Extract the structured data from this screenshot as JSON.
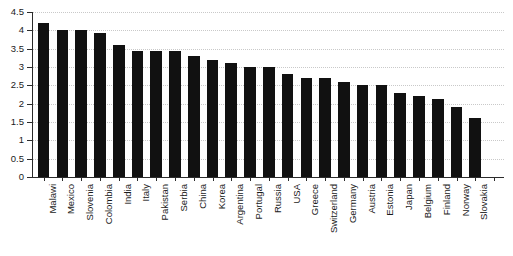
{
  "chart_data": {
    "type": "bar",
    "title": "",
    "subtitle": "",
    "xlabel": "",
    "ylabel": "",
    "ylim": [
      0,
      4.5
    ],
    "ytick_step": 0.5,
    "yticks": [
      "0",
      "0.5",
      "1",
      "1.5",
      "2",
      "2.5",
      "3",
      "3.5",
      "4",
      "4.5"
    ],
    "grid": true,
    "grid_style": "dotted-horizontal",
    "legend": "none",
    "bar_color": "#111111",
    "categories": [
      "Malawi",
      "Mexico",
      "Slovenia",
      "Colombia",
      "India",
      "Italy",
      "Pakistan",
      "Serbia",
      "China",
      "Korea",
      "Argentina",
      "Portugal",
      "Russia",
      "USA",
      "Greece",
      "Switzerland",
      "Germany",
      "Austria",
      "Estonia",
      "Japan",
      "Belgium",
      "Finland",
      "Norway",
      "Slovakia"
    ],
    "values": [
      4.2,
      4.0,
      4.0,
      3.92,
      3.6,
      3.45,
      3.45,
      3.45,
      3.3,
      3.2,
      3.1,
      3.0,
      3.0,
      2.8,
      2.7,
      2.7,
      2.6,
      2.5,
      2.5,
      2.3,
      2.22,
      2.12,
      1.92,
      1.6
    ]
  }
}
